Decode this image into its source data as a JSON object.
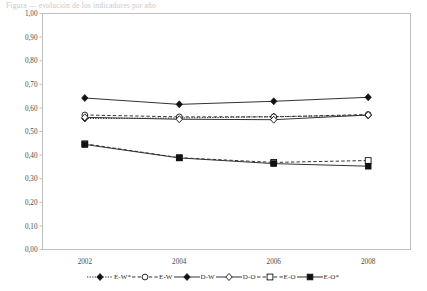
{
  "caption": {
    "text": "Figura — evolución de los indicadores por año"
  },
  "chart_data": {
    "type": "line",
    "title": "",
    "xlabel": "",
    "ylabel": "",
    "categories": [
      "2002",
      "2004",
      "2006",
      "2008"
    ],
    "x": [
      2002,
      2004,
      2006,
      2008
    ],
    "ylim": [
      0.0,
      1.0
    ],
    "ytick_step": 0.1,
    "ytick_labels": [
      "0,00",
      "0,10",
      "0,20",
      "0,30",
      "0,40",
      "0,50",
      "0,60",
      "0,70",
      "0,80",
      "0,90",
      "1,00"
    ],
    "ytick_values": [
      0.0,
      0.1,
      0.2,
      0.3,
      0.4,
      0.5,
      0.6,
      0.7,
      0.8,
      0.9,
      1.0
    ],
    "xtick_labels": [
      "2002",
      "2004",
      "2006",
      "2008"
    ],
    "grid": false,
    "legend_position": "bottom",
    "decimal_separator": ",",
    "series": [
      {
        "name": "E-W*",
        "marker": "filled-diamond",
        "linestyle": "dotted",
        "color": "#111111",
        "values": [
          0.555,
          0.557,
          0.563,
          0.568
        ]
      },
      {
        "name": "E-W",
        "marker": "open-circle",
        "linestyle": "dashed",
        "color": "#111111",
        "values": [
          0.57,
          0.562,
          0.562,
          0.572
        ]
      },
      {
        "name": "D-W",
        "marker": "filled-diamond",
        "linestyle": "solid",
        "color": "#111111",
        "values": [
          0.642,
          0.615,
          0.628,
          0.645
        ]
      },
      {
        "name": "D-O",
        "marker": "open-diamond",
        "linestyle": "solid",
        "color": "#111111",
        "values": [
          0.56,
          0.552,
          0.55,
          0.57
        ]
      },
      {
        "name": "E-O",
        "marker": "open-square",
        "linestyle": "dashed",
        "color": "#111111",
        "values": [
          0.448,
          0.389,
          0.369,
          0.377
        ]
      },
      {
        "name": "E-O*",
        "marker": "filled-square",
        "linestyle": "solid",
        "color": "#111111",
        "values": [
          0.445,
          0.388,
          0.364,
          0.353
        ]
      }
    ],
    "legend_entries": [
      "E-W*",
      "E-W",
      "D-W",
      "D-O",
      "E-O",
      "E-O*"
    ]
  }
}
